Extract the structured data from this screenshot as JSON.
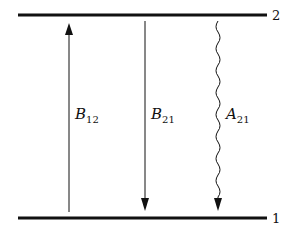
{
  "diagram": {
    "levels": [
      {
        "id": "upper",
        "label": "2"
      },
      {
        "id": "lower",
        "label": "1"
      }
    ],
    "transitions": [
      {
        "id": "absorption",
        "symbol": "B",
        "subscript": "12",
        "direction": "up",
        "style": "straight"
      },
      {
        "id": "stimulated-emission",
        "symbol": "B",
        "subscript": "21",
        "direction": "down",
        "style": "straight"
      },
      {
        "id": "spontaneous-emission",
        "symbol": "A",
        "subscript": "21",
        "direction": "down",
        "style": "wavy"
      }
    ],
    "colors": {
      "line": "#111111",
      "background": "#ffffff"
    }
  }
}
